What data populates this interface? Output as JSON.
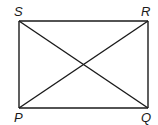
{
  "diagram": {
    "type": "rectangle-with-diagonals",
    "vertices": [
      {
        "label": "S",
        "x": 19,
        "y": 21,
        "lx": 14,
        "ly": 14
      },
      {
        "label": "R",
        "x": 148,
        "y": 21,
        "lx": 141,
        "ly": 14
      },
      {
        "label": "P",
        "x": 19,
        "y": 108,
        "lx": 14,
        "ly": 121
      },
      {
        "label": "Q",
        "x": 148,
        "y": 108,
        "lx": 141,
        "ly": 121
      }
    ],
    "stroke_color": "#1a1a1a"
  }
}
